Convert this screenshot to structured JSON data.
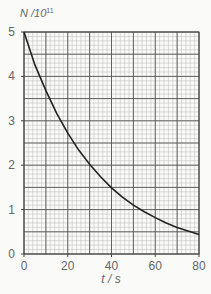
{
  "chart_data": {
    "type": "line",
    "title": "",
    "xlabel": "t / s",
    "ylabel": "N /10^11",
    "ylabel_base": "N /10",
    "ylabel_exp": "11",
    "xlim": [
      0,
      80
    ],
    "ylim": [
      0,
      5
    ],
    "x_ticks": [
      "0",
      "20",
      "40",
      "60",
      "80"
    ],
    "y_ticks": [
      "0",
      "1",
      "2",
      "3",
      "4",
      "5"
    ],
    "grid": {
      "major_x": 10,
      "minor_x": 2,
      "major_y": 0.5,
      "minor_y": 0.1
    },
    "series": [
      {
        "name": "N",
        "x": [
          0,
          5,
          10,
          15,
          20,
          25,
          30,
          35,
          40,
          45,
          50,
          55,
          60,
          65,
          70,
          75,
          80
        ],
        "values": [
          5.0,
          4.26,
          3.68,
          3.16,
          2.72,
          2.34,
          2.02,
          1.74,
          1.49,
          1.28,
          1.1,
          0.95,
          0.82,
          0.7,
          0.6,
          0.52,
          0.44
        ]
      }
    ],
    "legend": null,
    "colors": {
      "curve": "#222222",
      "major_grid": "#555555",
      "minor_grid": "#b8b8b8",
      "text": "#666666"
    }
  }
}
